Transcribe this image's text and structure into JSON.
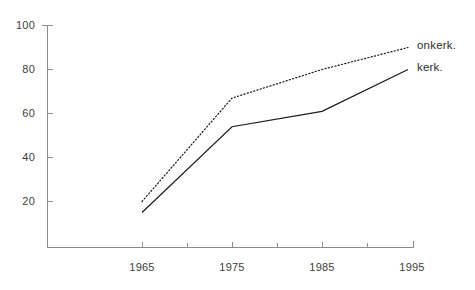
{
  "chart_data": {
    "type": "line",
    "title": "",
    "subtitle": "",
    "xlabel": "",
    "ylabel": "",
    "x": [
      1965,
      1975,
      1985,
      1995
    ],
    "xlim": [
      1963,
      1995
    ],
    "ylim": [
      0,
      100
    ],
    "x_tick_labels": [
      "1965",
      "1975",
      "1985",
      "1995"
    ],
    "x_minor_ticks": [
      1970,
      1980,
      1990
    ],
    "y_tick_labels": [
      "20",
      "40",
      "60",
      "80",
      "100"
    ],
    "y_ticks": [
      20,
      40,
      60,
      80,
      100
    ],
    "grid": false,
    "legend_position": "right-inline",
    "series": [
      {
        "name": "onkerk.",
        "style": "dotted",
        "color": "#1a1a1a",
        "values": [
          20,
          67,
          80,
          90
        ]
      },
      {
        "name": "kerk.",
        "style": "solid",
        "color": "#1a1a1a",
        "values": [
          15,
          54,
          61,
          80
        ]
      }
    ]
  },
  "axis": {
    "y_labels": [
      "100",
      "80",
      "60",
      "40",
      "20"
    ],
    "x_labels": [
      "1965",
      "1975",
      "1985",
      "1995"
    ]
  },
  "legend": {
    "items": [
      {
        "label": "onkerk."
      },
      {
        "label": "kerk."
      }
    ]
  },
  "colors": {
    "axis": "#8c8c8c",
    "line": "#1a1a1a",
    "text": "#3d3d3d",
    "background": "#ffffff"
  }
}
